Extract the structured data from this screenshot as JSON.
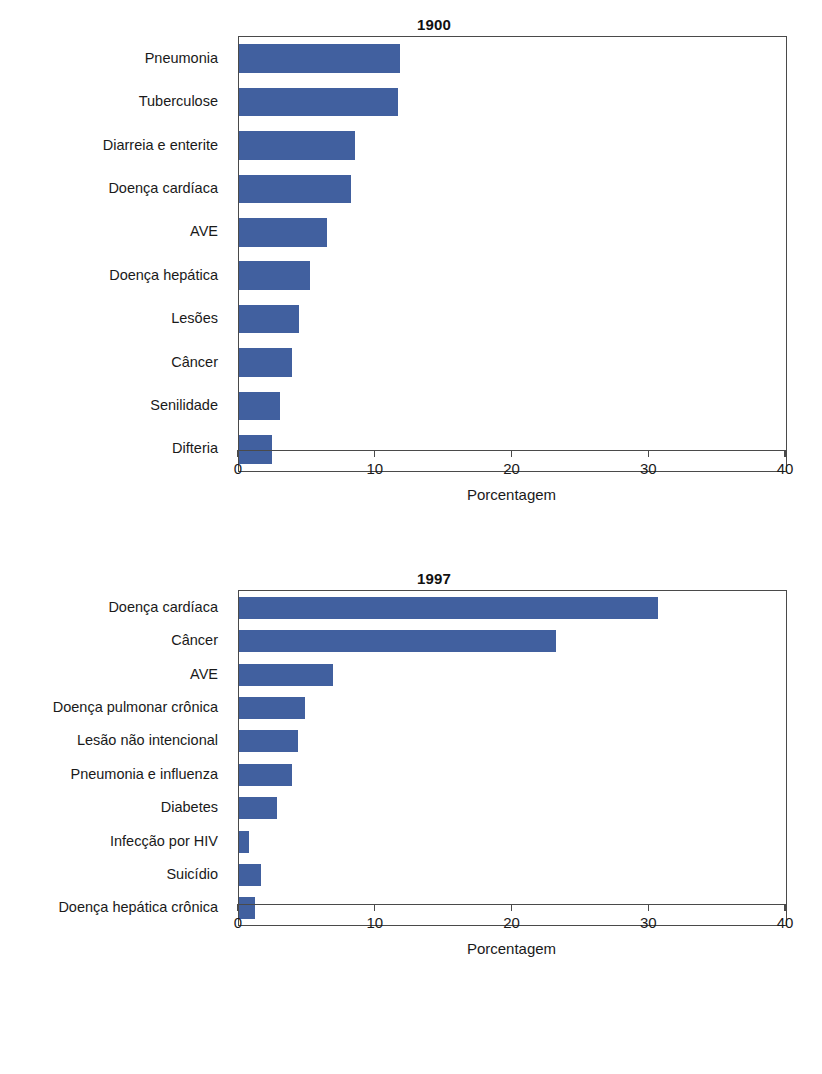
{
  "figure": {
    "kind": "paired-horizontal-bar-figure",
    "background": "#ffffff",
    "bar_color": "#41609f",
    "axis_color": "#4a4a4a"
  },
  "chart_data": [
    {
      "type": "bar",
      "orientation": "horizontal",
      "title": "1900",
      "xlabel": "Porcentagem",
      "ylabel": "",
      "xlim": [
        0,
        40
      ],
      "xticks": [
        0,
        10,
        20,
        30,
        40
      ],
      "xtick_labels": [
        "0",
        "10",
        "20",
        "30",
        "40"
      ],
      "grid": false,
      "legend": "none",
      "categories": [
        "Pneumonia",
        "Tuberculose",
        "Diarreia e enterite",
        "Doença cardíaca",
        "AVE",
        "Doença hepática",
        "Lesões",
        "Câncer",
        "Senilidade",
        "Difteria"
      ],
      "values": [
        11.8,
        11.6,
        8.5,
        8.2,
        6.4,
        5.2,
        4.4,
        3.9,
        3.0,
        2.4
      ],
      "bar_color": "#41609f"
    },
    {
      "type": "bar",
      "orientation": "horizontal",
      "title": "1997",
      "xlabel": "Porcentagem",
      "ylabel": "",
      "xlim": [
        0,
        40
      ],
      "xticks": [
        0,
        10,
        20,
        30,
        40
      ],
      "xtick_labels": [
        "0",
        "10",
        "20",
        "30",
        "40"
      ],
      "grid": false,
      "legend": "none",
      "categories": [
        "Doença cardíaca",
        "Câncer",
        "AVE",
        "Doença pulmonar crônica",
        "Lesão não intencional",
        "Pneumonia e influenza",
        "Diabetes",
        "Infecção por HIV",
        "Suicídio",
        "Doença hepática crônica"
      ],
      "values": [
        30.6,
        23.2,
        6.9,
        4.8,
        4.3,
        3.9,
        2.8,
        0.7,
        1.6,
        1.2
      ],
      "bar_color": "#41609f"
    }
  ]
}
